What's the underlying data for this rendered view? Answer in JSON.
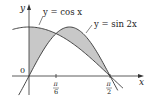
{
  "diagram": {
    "type": "function-plot",
    "axes": {
      "x_label": "x",
      "y_label": "y",
      "origin_label": "0"
    },
    "x_ticks": [
      {
        "label_num": "π",
        "label_den": "6",
        "value": "pi/6"
      },
      {
        "label_num": "π",
        "label_den": "2",
        "value": "pi/2"
      }
    ],
    "curves": [
      {
        "name": "cos",
        "label": "y = cos x"
      },
      {
        "name": "sin2x",
        "label": "y = sin 2x"
      }
    ],
    "shaded_region": {
      "between": [
        "cos x",
        "sin 2x"
      ],
      "x_range": [
        "0",
        "pi/2"
      ],
      "color": "#c8c8c8"
    },
    "colors": {
      "curve": "#333333",
      "axis": "#333333",
      "shade": "#c8c8c8"
    }
  }
}
